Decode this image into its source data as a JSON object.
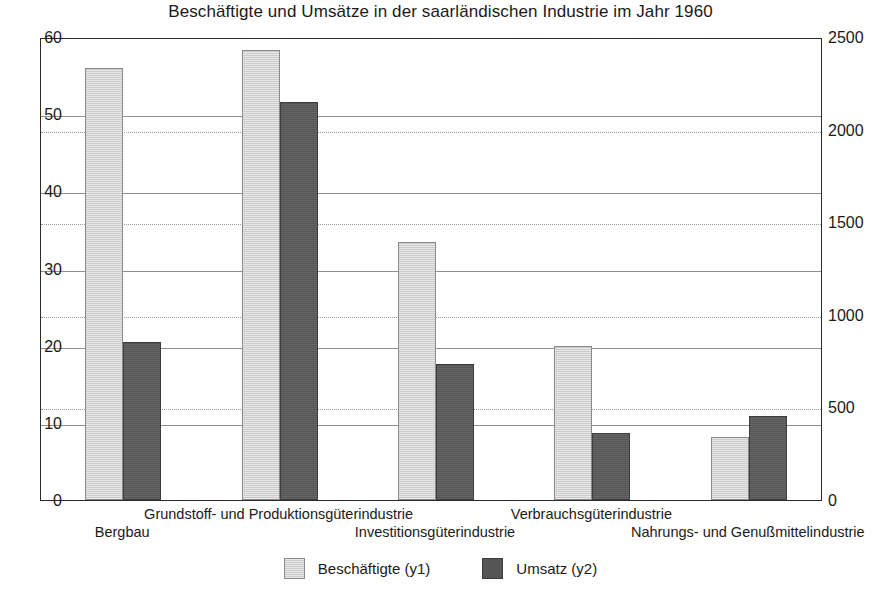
{
  "chart_data": {
    "type": "bar",
    "title": "Beschäftigte und Umsätze in der saarländischen Industrie im Jahr 1960",
    "xlabel": "",
    "ylabel": "",
    "categories": [
      "Bergbau",
      "Grundstoff- und Produktionsgüterindustrie",
      "Investitionsgüterindustrie",
      "Verbrauchsgüterindustrie",
      "Nahrungs- und Genußmittelindustrie"
    ],
    "series": [
      {
        "name": "Beschäftigte (y1)",
        "axis": "y1",
        "color": "#cbcbcb",
        "values": [
          56.0,
          58.3,
          33.4,
          20.0,
          8.2
        ]
      },
      {
        "name": "Umsatz (y2)",
        "axis": "y2",
        "color": "#555555",
        "values": [
          855,
          2150,
          735,
          360,
          455
        ]
      }
    ],
    "y1": {
      "label": "",
      "lim": [
        0,
        60
      ],
      "ticks": [
        0,
        10,
        20,
        30,
        40,
        50,
        60
      ],
      "ticklabels": [
        "0",
        "10",
        "20",
        "30",
        "40",
        "50",
        "60"
      ],
      "grid": "solid"
    },
    "y2": {
      "label": "",
      "lim": [
        0,
        2500
      ],
      "ticks": [
        0,
        500,
        1000,
        1500,
        2000,
        2500
      ],
      "ticklabels": [
        "0",
        "500",
        "1000",
        "1500",
        "2000",
        "2500"
      ],
      "grid": "dotted"
    },
    "legend": {
      "position": "bottom",
      "entries": [
        "Beschäftigte (y1)",
        "Umsatz (y2)"
      ]
    }
  }
}
